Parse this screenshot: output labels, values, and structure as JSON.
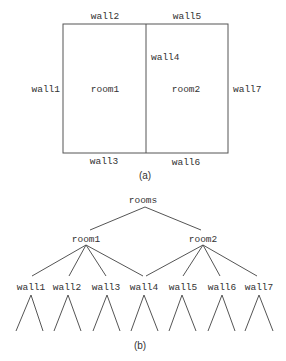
{
  "figure_a": {
    "caption": "(a)",
    "rooms": {
      "room1": "room1",
      "room2": "room2"
    },
    "walls": {
      "wall1": "wall1",
      "wall2": "wall2",
      "wall3": "wall3",
      "wall4": "wall4",
      "wall5": "wall5",
      "wall6": "wall6",
      "wall7": "wall7"
    }
  },
  "figure_b": {
    "caption": "(b)",
    "root": "rooms",
    "children": [
      {
        "label": "room1",
        "children": [
          "wall1",
          "wall2",
          "wall3",
          "wall4"
        ]
      },
      {
        "label": "room2",
        "children": [
          "wall4",
          "wall5",
          "wall6",
          "wall7"
        ]
      }
    ],
    "leaves": [
      "wall1",
      "wall2",
      "wall3",
      "wall4",
      "wall5",
      "wall6",
      "wall7"
    ]
  },
  "colors": {
    "line": "#555555",
    "text": "#333333",
    "background": "#ffffff"
  }
}
